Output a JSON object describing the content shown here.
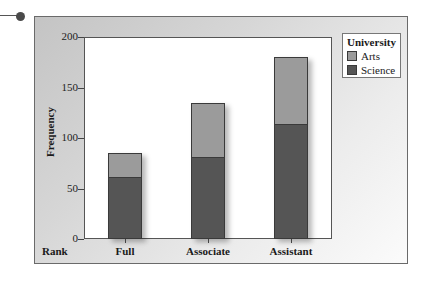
{
  "chart_data": {
    "type": "bar",
    "stacked": true,
    "title": "",
    "xlabel": "Rank",
    "ylabel": "Frequency",
    "ylim": [
      0,
      200
    ],
    "yticks": [
      0,
      50,
      100,
      150,
      200
    ],
    "categories": [
      "Full",
      "Associate",
      "Assistant"
    ],
    "series": [
      {
        "name": "Science",
        "values": [
          60,
          80,
          113
        ],
        "color": "#555555"
      },
      {
        "name": "Arts",
        "values": [
          25,
          55,
          67
        ],
        "color": "#9b9b9b"
      }
    ],
    "totals": [
      85,
      135,
      180
    ],
    "legend": {
      "title": "University",
      "entries": [
        "Arts",
        "Science"
      ],
      "position": "top-right"
    },
    "grid": false
  },
  "axis": {
    "ylabel": "Frequency",
    "xlabel": "Rank",
    "yticks": [
      "0",
      "50",
      "100",
      "150",
      "200"
    ],
    "categories": [
      "Full",
      "Associate",
      "Assistant"
    ]
  },
  "legend": {
    "title": "University",
    "items": [
      {
        "label": "Arts",
        "color": "#9b9b9b"
      },
      {
        "label": "Science",
        "color": "#555555"
      }
    ]
  }
}
